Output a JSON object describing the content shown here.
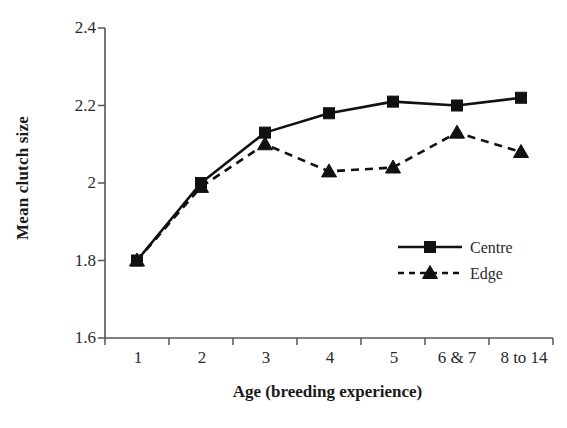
{
  "chart_data": {
    "type": "line",
    "title": "",
    "xlabel": "Age (breeding experience)",
    "ylabel": "Mean clutch size",
    "categories": [
      "1",
      "2",
      "3",
      "4",
      "5",
      "6 & 7",
      "8 to 14"
    ],
    "ylim": [
      1.6,
      2.4
    ],
    "yticks": [
      "1.6",
      "1.8",
      "2",
      "2.2",
      "2.4"
    ],
    "ytick_values": [
      1.6,
      1.8,
      2.0,
      2.2,
      2.4
    ],
    "grid": false,
    "legend_position": "center-right",
    "series": [
      {
        "name": "Centre",
        "marker": "square",
        "line_style": "solid",
        "color": "#111111",
        "values": [
          1.8,
          2.0,
          2.13,
          2.18,
          2.21,
          2.2,
          2.22
        ]
      },
      {
        "name": "Edge",
        "marker": "triangle",
        "line_style": "dashed",
        "color": "#111111",
        "values": [
          1.8,
          1.99,
          2.1,
          2.03,
          2.04,
          2.13,
          2.08
        ]
      }
    ]
  },
  "axes": {
    "y_title": "Mean clutch size",
    "x_title": "Age (breeding experience)",
    "ytick_0": "1.6",
    "ytick_1": "1.8",
    "ytick_2": "2",
    "ytick_3": "2.2",
    "ytick_4": "2.4",
    "xtick_0": "1",
    "xtick_1": "2",
    "xtick_2": "3",
    "xtick_3": "4",
    "xtick_4": "5",
    "xtick_5": "6 & 7",
    "xtick_6": "8 to 14"
  },
  "legend": {
    "item_0": "Centre",
    "item_1": "Edge"
  }
}
